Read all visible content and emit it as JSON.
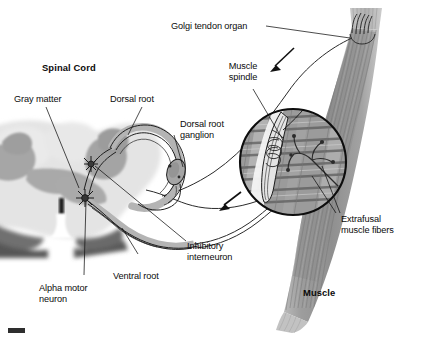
{
  "figure": {
    "type": "anatomical-diagram",
    "background_color": "#ffffff",
    "ink_color": "#111111"
  },
  "labels": {
    "spinal_cord": "Spinal Cord",
    "gray_matter": "Gray matter",
    "dorsal_root": "Dorsal root",
    "dorsal_root_ganglion_line1": "Dorsal root",
    "dorsal_root_ganglion_line2": "ganglion",
    "golgi_tendon_organ": "Golgi tendon organ",
    "muscle_spindle_line1": "Muscle",
    "muscle_spindle_line2": "spindle",
    "extrafusal_line1": "Extrafusal",
    "extrafusal_line2": "muscle fibers",
    "inhibitory_line1": "Inhibitory",
    "inhibitory_line2": "interneuron",
    "ventral_root": "Ventral root",
    "alpha_motor_line1": "Alpha motor",
    "alpha_motor_line2": "neuron",
    "muscle": "Muscle"
  },
  "colors": {
    "white_matter": "#e2e2e2",
    "gray_matter": "#a8a8a8",
    "dark_band": "#6e6e6e",
    "muscle_body": "#9a9a9a",
    "muscle_light": "#c9c9c9",
    "nerve_sheath": "#8c8c8c",
    "outline": "#141414"
  },
  "structures": [
    {
      "name": "spinal-cord-cross-section",
      "note": "butterfly gray matter with central canal"
    },
    {
      "name": "dorsal-root",
      "note": "afferent fibers entering dorsally"
    },
    {
      "name": "dorsal-root-ganglion",
      "note": "swelling on dorsal root"
    },
    {
      "name": "ventral-root",
      "note": "efferent motor fibers leaving ventrally"
    },
    {
      "name": "alpha-motor-neuron",
      "note": "star-shaped cell body in ventral horn"
    },
    {
      "name": "inhibitory-interneuron",
      "note": "star-shaped cell body in gray matter"
    },
    {
      "name": "muscle-belly",
      "note": "striated fusiform skeletal muscle"
    },
    {
      "name": "golgi-tendon-organ",
      "note": "receptor in tendon at top of muscle"
    },
    {
      "name": "muscle-spindle-inset",
      "note": "magnified circular inset of spindle and extrafusal fibers"
    },
    {
      "name": "afferent-arrow-upper",
      "note": "arrow pointing toward spinal cord"
    },
    {
      "name": "afferent-arrow-lower",
      "note": "arrow pointing toward spinal cord"
    },
    {
      "name": "scale-bar",
      "note": "small dark bar at bottom left"
    }
  ]
}
